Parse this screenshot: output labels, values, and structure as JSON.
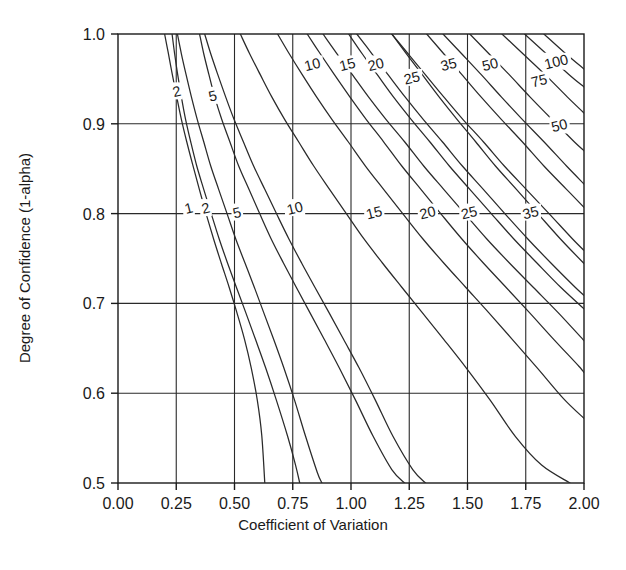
{
  "chart_data": {
    "type": "line",
    "title": "",
    "xlabel": "Coefficient of Variation",
    "ylabel": "Degree of Confidence (1-alpha)",
    "xlim": [
      0.0,
      2.0
    ],
    "ylim": [
      0.5,
      1.0
    ],
    "xticks": [
      "0.00",
      "0.25",
      "0.50",
      "0.75",
      "1.00",
      "1.25",
      "1.50",
      "1.75",
      "2.00"
    ],
    "xtick_values": [
      0.0,
      0.25,
      0.5,
      0.75,
      1.0,
      1.25,
      1.5,
      1.75,
      2.0
    ],
    "yticks": [
      "0.5",
      "0.6",
      "0.7",
      "0.8",
      "0.9",
      "1.0"
    ],
    "ytick_values": [
      0.5,
      0.6,
      0.7,
      0.8,
      0.9,
      1.0
    ],
    "grid": true,
    "grid_x": [
      0.25,
      0.5,
      0.75,
      1.0,
      1.25,
      1.5,
      1.75
    ],
    "grid_y": [
      0.6,
      0.7,
      0.8,
      0.9
    ],
    "legend": "none",
    "series": [
      {
        "name": "1",
        "label": "1",
        "label_xy": [
          0.305,
          0.805
        ],
        "points": [
          [
            0.2,
            1.0
          ],
          [
            0.215,
            0.98
          ],
          [
            0.233,
            0.955
          ],
          [
            0.252,
            0.93
          ],
          [
            0.272,
            0.905
          ],
          [
            0.295,
            0.88
          ],
          [
            0.32,
            0.855
          ],
          [
            0.348,
            0.828
          ],
          [
            0.378,
            0.8
          ],
          [
            0.41,
            0.772
          ],
          [
            0.443,
            0.745
          ],
          [
            0.477,
            0.718
          ],
          [
            0.51,
            0.69
          ],
          [
            0.543,
            0.66
          ],
          [
            0.572,
            0.628
          ],
          [
            0.598,
            0.592
          ],
          [
            0.617,
            0.553
          ],
          [
            0.63,
            0.5
          ]
        ]
      },
      {
        "name": "2",
        "label": "2",
        "label_xy": [
          0.378,
          0.805
        ],
        "points": [
          [
            0.255,
            1.0
          ],
          [
            0.272,
            0.978
          ],
          [
            0.292,
            0.955
          ],
          [
            0.315,
            0.93
          ],
          [
            0.34,
            0.905
          ],
          [
            0.368,
            0.88
          ],
          [
            0.398,
            0.853
          ],
          [
            0.432,
            0.827
          ],
          [
            0.468,
            0.8
          ],
          [
            0.505,
            0.772
          ],
          [
            0.545,
            0.745
          ],
          [
            0.585,
            0.718
          ],
          [
            0.625,
            0.69
          ],
          [
            0.668,
            0.66
          ],
          [
            0.712,
            0.628
          ],
          [
            0.758,
            0.592
          ],
          [
            0.805,
            0.552
          ],
          [
            0.855,
            0.512
          ],
          [
            0.875,
            0.5
          ]
        ]
      },
      {
        "name": "2b",
        "label": "2",
        "label_xy": [
          0.253,
          0.935
        ],
        "points": [
          [
            0.232,
            1.0
          ],
          [
            0.243,
            0.978
          ],
          [
            0.256,
            0.955
          ],
          [
            0.272,
            0.93
          ],
          [
            0.29,
            0.905
          ],
          [
            0.312,
            0.88
          ],
          [
            0.338,
            0.853
          ],
          [
            0.368,
            0.827
          ],
          [
            0.4,
            0.8
          ],
          [
            0.434,
            0.772
          ],
          [
            0.47,
            0.745
          ],
          [
            0.508,
            0.718
          ],
          [
            0.548,
            0.69
          ],
          [
            0.59,
            0.66
          ],
          [
            0.634,
            0.628
          ],
          [
            0.68,
            0.592
          ],
          [
            0.728,
            0.552
          ],
          [
            0.762,
            0.52
          ],
          [
            0.78,
            0.5
          ]
        ]
      },
      {
        "name": "5",
        "label": "5",
        "label_xy": [
          0.512,
          0.8
        ],
        "points": [
          [
            0.372,
            1.0
          ],
          [
            0.398,
            0.978
          ],
          [
            0.428,
            0.955
          ],
          [
            0.462,
            0.93
          ],
          [
            0.498,
            0.905
          ],
          [
            0.538,
            0.88
          ],
          [
            0.582,
            0.853
          ],
          [
            0.63,
            0.827
          ],
          [
            0.68,
            0.8
          ],
          [
            0.733,
            0.772
          ],
          [
            0.788,
            0.745
          ],
          [
            0.845,
            0.718
          ],
          [
            0.905,
            0.69
          ],
          [
            0.968,
            0.66
          ],
          [
            1.035,
            0.628
          ],
          [
            1.105,
            0.592
          ],
          [
            1.18,
            0.552
          ],
          [
            1.265,
            0.515
          ],
          [
            1.32,
            0.5
          ]
        ]
      },
      {
        "name": "5b",
        "label": "5",
        "label_xy": [
          0.408,
          0.93
        ],
        "points": [
          [
            0.35,
            1.0
          ],
          [
            0.368,
            0.978
          ],
          [
            0.39,
            0.955
          ],
          [
            0.415,
            0.93
          ],
          [
            0.445,
            0.905
          ],
          [
            0.48,
            0.88
          ],
          [
            0.518,
            0.853
          ],
          [
            0.562,
            0.827
          ],
          [
            0.608,
            0.8
          ],
          [
            0.657,
            0.772
          ],
          [
            0.71,
            0.745
          ],
          [
            0.765,
            0.718
          ],
          [
            0.823,
            0.69
          ],
          [
            0.885,
            0.66
          ],
          [
            0.95,
            0.628
          ],
          [
            1.02,
            0.592
          ],
          [
            1.095,
            0.552
          ],
          [
            1.175,
            0.515
          ],
          [
            1.23,
            0.5
          ]
        ]
      },
      {
        "name": "10",
        "label": "10",
        "label_xy": [
          0.76,
          0.805
        ],
        "points": [
          [
            0.525,
            1.0
          ],
          [
            0.565,
            0.978
          ],
          [
            0.61,
            0.955
          ],
          [
            0.66,
            0.93
          ],
          [
            0.715,
            0.905
          ],
          [
            0.775,
            0.88
          ],
          [
            0.84,
            0.853
          ],
          [
            0.908,
            0.827
          ],
          [
            0.98,
            0.8
          ],
          [
            1.055,
            0.772
          ],
          [
            1.135,
            0.745
          ],
          [
            1.218,
            0.718
          ],
          [
            1.305,
            0.69
          ],
          [
            1.398,
            0.66
          ],
          [
            1.495,
            0.628
          ],
          [
            1.598,
            0.592
          ],
          [
            1.705,
            0.552
          ],
          [
            1.818,
            0.52
          ],
          [
            1.94,
            0.5
          ]
        ]
      },
      {
        "name": "10b",
        "label": "10",
        "label_xy": [
          0.835,
          0.965
        ],
        "points": [
          [
            0.685,
            1.0
          ],
          [
            0.735,
            0.978
          ],
          [
            0.79,
            0.955
          ],
          [
            0.852,
            0.93
          ],
          [
            0.918,
            0.905
          ],
          [
            0.988,
            0.88
          ],
          [
            1.062,
            0.853
          ],
          [
            1.14,
            0.827
          ],
          [
            1.222,
            0.8
          ],
          [
            1.308,
            0.772
          ],
          [
            1.398,
            0.745
          ],
          [
            1.492,
            0.718
          ],
          [
            1.59,
            0.69
          ],
          [
            1.692,
            0.66
          ],
          [
            1.8,
            0.628
          ],
          [
            1.912,
            0.594
          ],
          [
            2.0,
            0.572
          ]
        ]
      },
      {
        "name": "15",
        "label": "15",
        "label_xy": [
          1.1,
          0.8
        ],
        "points": [
          [
            0.812,
            1.0
          ],
          [
            0.868,
            0.978
          ],
          [
            0.928,
            0.955
          ],
          [
            0.995,
            0.93
          ],
          [
            1.065,
            0.905
          ],
          [
            1.14,
            0.88
          ],
          [
            1.218,
            0.853
          ],
          [
            1.3,
            0.827
          ],
          [
            1.385,
            0.8
          ],
          [
            1.475,
            0.772
          ],
          [
            1.568,
            0.745
          ],
          [
            1.665,
            0.718
          ],
          [
            1.765,
            0.69
          ],
          [
            1.87,
            0.66
          ],
          [
            1.978,
            0.63
          ],
          [
            2.0,
            0.623
          ]
        ]
      },
      {
        "name": "15b",
        "label": "15",
        "label_xy": [
          0.985,
          0.965
        ],
        "points": [
          [
            0.88,
            1.0
          ],
          [
            0.94,
            0.978
          ],
          [
            1.005,
            0.955
          ],
          [
            1.075,
            0.93
          ],
          [
            1.15,
            0.905
          ],
          [
            1.23,
            0.88
          ],
          [
            1.312,
            0.853
          ],
          [
            1.398,
            0.827
          ],
          [
            1.488,
            0.8
          ],
          [
            1.582,
            0.772
          ],
          [
            1.68,
            0.745
          ],
          [
            1.782,
            0.718
          ],
          [
            1.888,
            0.69
          ],
          [
            1.995,
            0.66
          ],
          [
            2.0,
            0.659
          ]
        ]
      },
      {
        "name": "20",
        "label": "20",
        "label_xy": [
          1.33,
          0.8
        ],
        "points": [
          [
            1.025,
            1.0
          ],
          [
            1.09,
            0.978
          ],
          [
            1.158,
            0.955
          ],
          [
            1.232,
            0.93
          ],
          [
            1.31,
            0.905
          ],
          [
            1.392,
            0.88
          ],
          [
            1.478,
            0.853
          ],
          [
            1.568,
            0.827
          ],
          [
            1.66,
            0.8
          ],
          [
            1.758,
            0.772
          ],
          [
            1.858,
            0.745
          ],
          [
            1.962,
            0.718
          ],
          [
            2.0,
            0.709
          ]
        ]
      },
      {
        "name": "20b",
        "label": "20",
        "label_xy": [
          1.108,
          0.965
        ],
        "points": [
          [
            0.99,
            1.0
          ],
          [
            1.048,
            0.978
          ],
          [
            1.112,
            0.955
          ],
          [
            1.182,
            0.93
          ],
          [
            1.258,
            0.905
          ],
          [
            1.338,
            0.88
          ],
          [
            1.422,
            0.853
          ],
          [
            1.51,
            0.827
          ],
          [
            1.602,
            0.8
          ],
          [
            1.698,
            0.772
          ],
          [
            1.798,
            0.745
          ],
          [
            1.9,
            0.718
          ],
          [
            2.0,
            0.694
          ]
        ]
      },
      {
        "name": "25",
        "label": "25",
        "label_xy": [
          1.508,
          0.8
        ],
        "points": [
          [
            1.175,
            1.0
          ],
          [
            1.245,
            0.978
          ],
          [
            1.318,
            0.955
          ],
          [
            1.398,
            0.93
          ],
          [
            1.48,
            0.905
          ],
          [
            1.568,
            0.88
          ],
          [
            1.658,
            0.853
          ],
          [
            1.752,
            0.827
          ],
          [
            1.85,
            0.8
          ],
          [
            1.95,
            0.772
          ],
          [
            2.0,
            0.759
          ]
        ]
      },
      {
        "name": "25b",
        "label": "25",
        "label_xy": [
          1.262,
          0.95
        ],
        "points": [
          [
            1.175,
            1.0
          ],
          [
            1.238,
            0.978
          ],
          [
            1.305,
            0.955
          ],
          [
            1.378,
            0.93
          ],
          [
            1.455,
            0.905
          ],
          [
            1.535,
            0.88
          ],
          [
            1.62,
            0.853
          ],
          [
            1.71,
            0.827
          ],
          [
            1.802,
            0.8
          ],
          [
            1.898,
            0.772
          ],
          [
            1.998,
            0.745
          ],
          [
            2.0,
            0.745
          ]
        ]
      },
      {
        "name": "35",
        "label": "35",
        "label_xy": [
          1.772,
          0.8
        ],
        "points": [
          [
            1.395,
            1.0
          ],
          [
            1.475,
            0.978
          ],
          [
            1.558,
            0.955
          ],
          [
            1.645,
            0.93
          ],
          [
            1.735,
            0.905
          ],
          [
            1.828,
            0.88
          ],
          [
            1.925,
            0.853
          ],
          [
            2.0,
            0.833
          ]
        ]
      },
      {
        "name": "35b",
        "label": "35",
        "label_xy": [
          1.42,
          0.965
        ],
        "points": [
          [
            1.325,
            1.0
          ],
          [
            1.398,
            0.978
          ],
          [
            1.475,
            0.955
          ],
          [
            1.558,
            0.93
          ],
          [
            1.645,
            0.905
          ],
          [
            1.735,
            0.88
          ],
          [
            1.828,
            0.853
          ],
          [
            1.925,
            0.827
          ],
          [
            2.0,
            0.807
          ]
        ]
      },
      {
        "name": "50",
        "label": "50",
        "label_xy": [
          1.598,
          0.965
        ],
        "points": [
          [
            1.51,
            1.0
          ],
          [
            1.592,
            0.978
          ],
          [
            1.678,
            0.955
          ],
          [
            1.768,
            0.93
          ],
          [
            1.862,
            0.905
          ],
          [
            1.958,
            0.88
          ],
          [
            2.0,
            0.87
          ]
        ]
      },
      {
        "name": "50b",
        "label": "50",
        "label_xy": [
          1.895,
          0.897
        ],
        "points": [
          [
            1.648,
            1.0
          ],
          [
            1.738,
            0.978
          ],
          [
            1.832,
            0.955
          ],
          [
            1.928,
            0.93
          ],
          [
            2.0,
            0.912
          ]
        ]
      },
      {
        "name": "75",
        "label": "75",
        "label_xy": [
          1.808,
          0.947
        ],
        "points": [
          [
            1.745,
            1.0
          ],
          [
            1.838,
            0.978
          ],
          [
            1.935,
            0.955
          ],
          [
            2.0,
            0.941
          ]
        ]
      },
      {
        "name": "100",
        "label": "100",
        "label_xy": [
          1.882,
          0.968
        ],
        "points": [
          [
            1.828,
            1.0
          ],
          [
            1.922,
            0.978
          ],
          [
            2.0,
            0.961
          ]
        ]
      }
    ]
  },
  "axes": {
    "x_title": "Coefficient of Variation",
    "y_title": "Degree of Confidence (1-alpha)"
  },
  "colors": {
    "line": "#2a2a2a",
    "grid": "#2a2a2a",
    "axis": "#1a1a1a",
    "background": "#ffffff",
    "text": "#1a1a1a"
  }
}
